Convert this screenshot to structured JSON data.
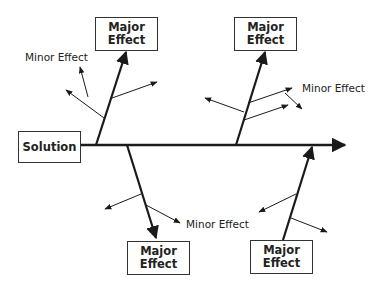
{
  "diagram": {
    "type": "fishbone",
    "head": {
      "label": "Solution"
    },
    "major_effects": [
      {
        "position": "top-left",
        "label_line1": "Major",
        "label_line2": "Effect",
        "minor_label": "Minor Effect"
      },
      {
        "position": "top-right",
        "label_line1": "Major",
        "label_line2": "Effect",
        "minor_label": "Minor Effect"
      },
      {
        "position": "bottom-left",
        "label_line1": "Major",
        "label_line2": "Effect",
        "minor_label": "Minor Effect"
      },
      {
        "position": "bottom-right",
        "label_line1": "Major",
        "label_line2": "Effect"
      }
    ],
    "colors": {
      "line": "#1a1a1a",
      "box_border": "#333333",
      "background": "#ffffff"
    }
  }
}
